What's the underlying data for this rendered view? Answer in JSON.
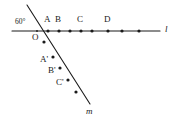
{
  "figure": {
    "background_color": "#ffffff",
    "stroke_color": "#1a1a1a",
    "text_color": "#1a1a1a",
    "width": 179,
    "height": 125
  },
  "lines": [
    {
      "name": "line-l",
      "label": "l",
      "label_x": 165,
      "label_y": 25,
      "x1": 12,
      "y1": 31,
      "x2": 160,
      "y2": 31
    },
    {
      "name": "line-m",
      "label": "m",
      "label_x": 86,
      "label_y": 107,
      "x1": 27,
      "y1": 5,
      "x2": 90,
      "y2": 104
    }
  ],
  "angle": {
    "name": "angle-60",
    "value": "60",
    "unit": "°",
    "text": "60°",
    "label_x": 15,
    "label_y": 18
  },
  "origin": {
    "name": "point-O",
    "label": "O",
    "x": 37,
    "y": 31,
    "label_x": 32,
    "label_y": 33
  },
  "points_on_l": [
    {
      "label": "A",
      "x": 48,
      "y": 31,
      "label_x": 44,
      "label_y": 15
    },
    {
      "label": "B",
      "x": 59,
      "y": 31,
      "label_x": 55,
      "label_y": 15
    },
    {
      "label": "",
      "x": 70,
      "y": 31,
      "label_x": 0,
      "label_y": 0
    },
    {
      "label": "C",
      "x": 81,
      "y": 31,
      "label_x": 77,
      "label_y": 15
    },
    {
      "label": "",
      "x": 92,
      "y": 31,
      "label_x": 0,
      "label_y": 0
    },
    {
      "label": "D",
      "x": 108,
      "y": 31,
      "label_x": 104,
      "label_y": 15
    },
    {
      "label": "",
      "x": 122,
      "y": 31,
      "label_x": 0,
      "label_y": 0
    },
    {
      "label": "",
      "x": 139,
      "y": 31,
      "label_x": 0,
      "label_y": 0
    }
  ],
  "points_on_m": [
    {
      "label": "",
      "x": 44,
      "y": 42,
      "label_x": 0,
      "label_y": 0
    },
    {
      "label": "A'",
      "x": 53,
      "y": 57,
      "label_x": 40,
      "label_y": 55
    },
    {
      "label": "B'",
      "x": 60,
      "y": 68,
      "label_x": 48,
      "label_y": 66
    },
    {
      "label": "C'",
      "x": 68,
      "y": 80,
      "label_x": 56,
      "label_y": 78
    },
    {
      "label": "",
      "x": 76,
      "y": 92,
      "label_x": 0,
      "label_y": 0
    }
  ],
  "style": {
    "line_width": 1.1,
    "dot_radius": 1.6
  }
}
